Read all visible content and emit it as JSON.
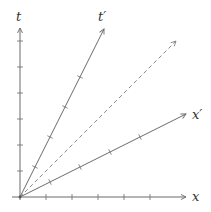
{
  "diagram": {
    "type": "spacetime-diagram",
    "colors": {
      "axis": "#6b6b6b",
      "dashed": "#8a8a8a",
      "label": "#333333"
    },
    "origin": [
      20,
      197
    ],
    "tick_spacing": 26,
    "labels": {
      "t": "t",
      "t_prime": "t′",
      "x": "x",
      "x_prime": "x′"
    },
    "axes": {
      "t": {
        "end": [
          20,
          27
        ],
        "ticks": 6
      },
      "x": {
        "end": [
          187,
          197
        ],
        "ticks": 6
      },
      "t_prime": {
        "end": [
          104,
          28
        ],
        "ticks": 4
      },
      "x_prime": {
        "end": [
          187,
          113
        ],
        "ticks": 4
      },
      "light_cone": {
        "end": [
          176,
          40
        ],
        "style": "dashed"
      }
    }
  }
}
